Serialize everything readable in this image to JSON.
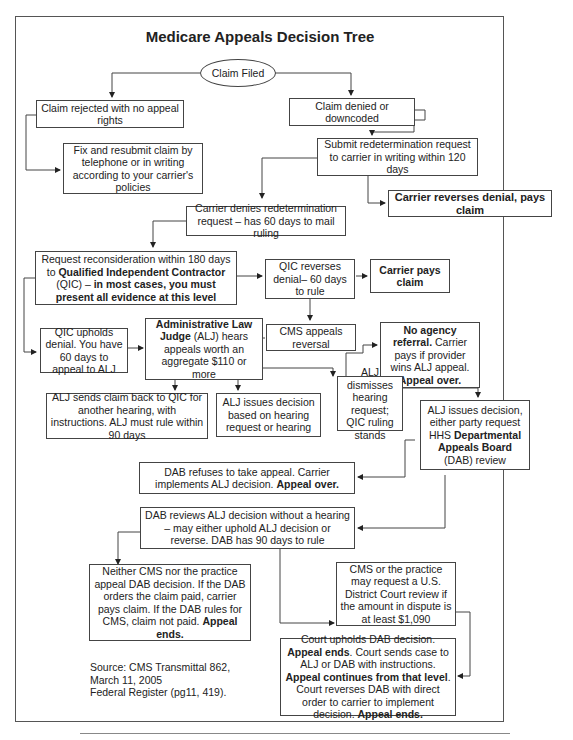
{
  "title": "Medicare Appeals Decision Tree",
  "nodes": {
    "claim_filed": "Claim Filed",
    "rejected": "Claim rejected with no appeal rights",
    "fix_resubmit": "Fix and resubmit claim by telephone or in writing according to your carrier's policies",
    "denied": "Claim denied or downcoded",
    "redetermination": "Submit redetermination request to carrier in writing within 120 days",
    "carrier_reverses": "Carrier reverses denial, pays claim",
    "carrier_denies": "Carrier denies redetermination request – has 60 days to mail ruling",
    "reconsideration": {
      "t1": "Request reconsideration within 180 days to ",
      "b1": "Qualified Independent Contractor",
      "t2": " (QIC) – ",
      "b2": "in most cases, you must present all evidence at this level"
    },
    "qic_reverses": "QIC reverses denial– 60 days to rule",
    "carrier_pays": "Carrier pays claim",
    "qic_upholds": "QIC upholds denial. You have 60 days to appeal to ALJ",
    "alj": {
      "b1": "Administrative Law Judge",
      "t1": " (ALJ) hears appeals worth an aggregate $110 or more"
    },
    "cms_appeals": "CMS appeals reversal",
    "no_agency": {
      "b1": "No agency referral.",
      "t1": " Carrier pays if provider wins ALJ appeal. ",
      "b2": "Appeal over."
    },
    "alj_sends_back": "ALJ sends claim back to QIC for another hearing, with instructions. ALJ must rule within 90 days",
    "alj_issues_hearing": "ALJ issues decision based on hearing request or hearing",
    "alj_dismisses": "ALJ dismisses hearing request; QIC ruling stands",
    "alj_issues_dab": {
      "t1": "ALJ issues decision, either party request HHS ",
      "b1": "Departmental Appeals Board",
      "t2": " (DAB) review"
    },
    "dab_refuses": {
      "t1": "DAB refuses to take appeal. Carrier implements ALJ decision. ",
      "b1": "Appeal over."
    },
    "dab_reviews": "DAB reviews ALJ decision without a hearing – may either uphold ALJ decision or reverse. DAB has 90 days to rule",
    "neither_appeal": {
      "t1": "Neither CMS nor the practice appeal DAB decision. If the DAB orders the claim paid, carrier pays claim. If the DAB rules for CMS, claim not paid. ",
      "b1": "Appeal ends."
    },
    "district_court": "CMS or the practice may request a U.S. District Court review if the amount in dispute is at least $1,090",
    "court": {
      "t1": "Court upholds DAB decision. ",
      "b1": "Appeal ends",
      "t2": ". Court sends case to ALJ or DAB with instructions. ",
      "b2": "Appeal continues from that level",
      "t3": ". Court reverses DAB with direct order to carrier to implement decision. ",
      "b3": "Appeal ends."
    }
  },
  "source": {
    "line1": "Source: CMS Transmittal 862,",
    "line2": "March 11, 2005",
    "line3": "Federal Register (pg11, 419)."
  }
}
